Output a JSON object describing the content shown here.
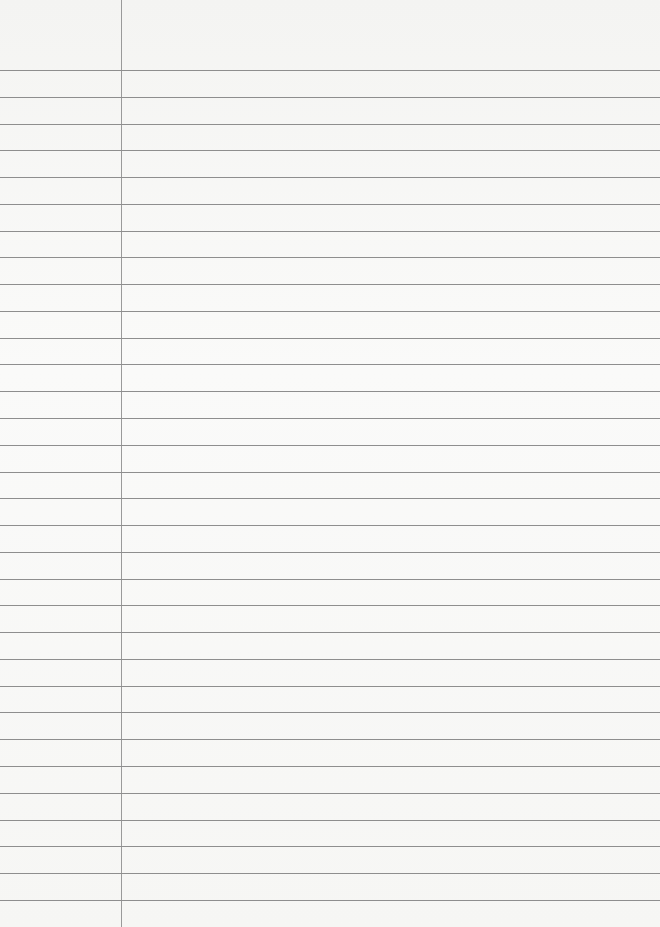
{
  "document": {
    "type": "ruled notebook page",
    "ruled_line_count": 32,
    "has_margin_line": true,
    "text_content": [],
    "colors": {
      "paper": "#f7f7f5",
      "rule_line": "#8e8e8e",
      "margin_line": "#9a9a9a"
    }
  }
}
